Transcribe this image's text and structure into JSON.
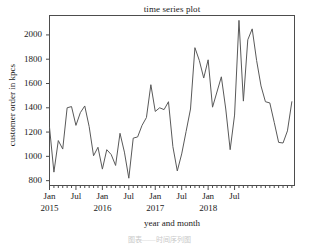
{
  "chart_data": {
    "type": "line",
    "title": "time series plot",
    "xlabel": "year and month",
    "ylabel": "customer order in kpcs",
    "ylim": [
      760,
      2160
    ],
    "xlim": [
      0,
      46
    ],
    "grid": false,
    "legend": null,
    "series_color": "#595959",
    "axis_color": "#4d4d4d",
    "ytick_values": [
      800,
      1000,
      1200,
      1400,
      1600,
      1800,
      2000
    ],
    "ytick_labels": [
      "800",
      "1000",
      "1200",
      "1400",
      "1600",
      "1800",
      "2000"
    ],
    "xtick_major_index": [
      0,
      6,
      12,
      18,
      24,
      30,
      36,
      42
    ],
    "xtick_major_labels": [
      "Jan",
      "Jul",
      "Jan",
      "Jul",
      "Jan",
      "Jul",
      "Jan",
      "Jul"
    ],
    "xtick_year_index": [
      0,
      12,
      24,
      36
    ],
    "xtick_year_labels": [
      "2015",
      "2016",
      "2017",
      "2018"
    ],
    "x": [
      "2015-01",
      "2015-02",
      "2015-03",
      "2015-04",
      "2015-05",
      "2015-06",
      "2015-07",
      "2015-08",
      "2015-09",
      "2015-10",
      "2015-11",
      "2015-12",
      "2016-01",
      "2016-02",
      "2016-03",
      "2016-04",
      "2016-05",
      "2016-06",
      "2016-07",
      "2016-08",
      "2016-09",
      "2016-10",
      "2016-11",
      "2016-12",
      "2017-01",
      "2017-02",
      "2017-03",
      "2017-04",
      "2017-05",
      "2017-06",
      "2017-07",
      "2017-08",
      "2017-09",
      "2017-10",
      "2017-11",
      "2017-12",
      "2018-01",
      "2018-02",
      "2018-03",
      "2018-04",
      "2018-05",
      "2018-06",
      "2018-07",
      "2018-08",
      "2018-09",
      "2018-10",
      "2018-11"
    ],
    "values": [
      1240,
      870,
      1130,
      1060,
      1400,
      1410,
      1255,
      1360,
      1415,
      1245,
      1005,
      1075,
      895,
      1055,
      1015,
      925,
      1190,
      1035,
      820,
      1150,
      1160,
      1255,
      1320,
      1590,
      1370,
      1400,
      1385,
      1450,
      1080,
      880,
      1020,
      1205,
      1390,
      1895,
      1790,
      1645,
      1795,
      1405,
      1530,
      1655,
      1390,
      1055,
      1340,
      2120,
      1455,
      1960,
      2050
    ],
    "values_tail": [
      2050,
      1790,
      1580,
      1450,
      1440,
      1280,
      1115,
      1110,
      1210,
      1450
    ]
  },
  "caption": "图表——时间序列图"
}
